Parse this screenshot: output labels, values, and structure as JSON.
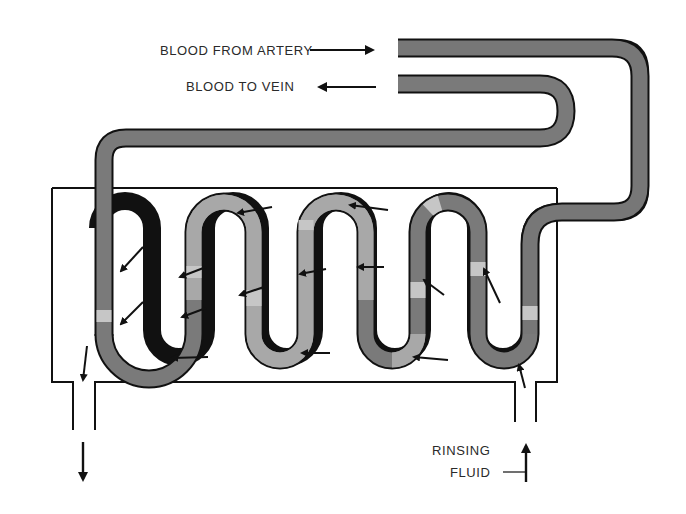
{
  "diagram": {
    "labels": {
      "blood_from_artery": "BLOOD FROM ARTERY",
      "blood_to_vein": "BLOOD TO VEIN",
      "rinsing": "RINSING",
      "fluid": "FLUID"
    },
    "colors": {
      "tube_dark": "#6f6f6f",
      "tube_light": "#a9a9a9",
      "tube_highlight": "#c4c4c4",
      "outline": "#111111",
      "background": "#ffffff"
    },
    "icons": {
      "inflow_arrow": "arrow-right",
      "outflow_arrow": "arrow-left",
      "flow_arrows": "arrow"
    }
  }
}
